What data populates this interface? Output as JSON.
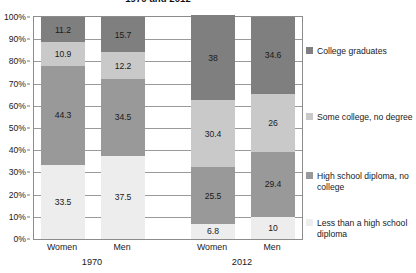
{
  "chart_title": "1970 and 2012",
  "axis": {
    "y_ticks": [
      "100%",
      "90%",
      "80%",
      "70%",
      "60%",
      "50%",
      "40%",
      "30%",
      "20%",
      "10%",
      "0%"
    ],
    "ylabel": "",
    "xlabel": ""
  },
  "x_categories": [
    "Women",
    "Men",
    "Women",
    "Men"
  ],
  "x_groups": [
    "1970",
    "2012"
  ],
  "legend": [
    {
      "label": "College graduates",
      "color": "#7f7f7f"
    },
    {
      "label": "Some college, no degree",
      "color": "#c9c9c9"
    },
    {
      "label": "High school diploma, no college",
      "color": "#999999"
    },
    {
      "label": "Less than a high school diploma",
      "color": "#ededed"
    }
  ],
  "colors": {
    "college_graduates": "#7f7f7f",
    "some_college": "#c9c9c9",
    "high_school": "#999999",
    "less_than_high_school": "#ededed",
    "axis": "#8c8c8c",
    "gridline": "#9a9a9a",
    "text": "#1a1a1a",
    "background": "#ffffff"
  },
  "chart_data": {
    "type": "bar",
    "subtype": "stacked-column-100",
    "title": "1970 and 2012",
    "xlabel": "",
    "ylabel": "",
    "ylim": [
      0,
      100
    ],
    "y_tick_values": [
      0,
      10,
      20,
      30,
      40,
      50,
      60,
      70,
      80,
      90,
      100
    ],
    "y_tick_labels": [
      "0%",
      "10%",
      "20%",
      "30%",
      "40%",
      "50%",
      "60%",
      "70%",
      "80%",
      "90%",
      "100%"
    ],
    "grid": true,
    "legend_position": "right",
    "categories": [
      "1970 Women",
      "1970 Men",
      "2012 Women",
      "2012 Men"
    ],
    "group_labels": [
      "1970",
      "2012"
    ],
    "category_short_labels": [
      "Women",
      "Men",
      "Women",
      "Men"
    ],
    "series": [
      {
        "name": "Less than a high school diploma",
        "color": "#ededed",
        "values": [
          33.5,
          37.5,
          6.8,
          10
        ],
        "value_labels": [
          "33.5",
          "37.5",
          "6.8",
          "10"
        ]
      },
      {
        "name": "High school diploma, no college",
        "color": "#999999",
        "values": [
          44.3,
          34.5,
          25.5,
          29.4
        ],
        "value_labels": [
          "44.3",
          "34.5",
          "25.5",
          "29.4"
        ]
      },
      {
        "name": "Some college, no degree",
        "color": "#c9c9c9",
        "values": [
          10.9,
          12.2,
          30.4,
          26
        ],
        "value_labels": [
          "10.9",
          "12.2",
          "30.4",
          "26"
        ]
      },
      {
        "name": "College graduates",
        "color": "#7f7f7f",
        "values": [
          11.2,
          15.7,
          38,
          34.6
        ],
        "value_labels": [
          "11.2",
          "15.7",
          "38",
          "34.6"
        ]
      }
    ]
  }
}
